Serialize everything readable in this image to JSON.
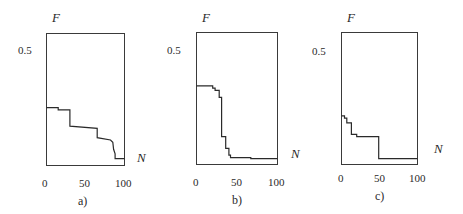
{
  "chart_data": [
    {
      "type": "line",
      "subplot_label": "a)",
      "xlabel": "N",
      "ylabel": "F",
      "x_ticks": [
        "0",
        "50",
        "100"
      ],
      "y_ticks": [
        "0.5"
      ],
      "xlim": [
        0,
        100
      ],
      "ylim": [
        0,
        0.57
      ],
      "grid": false,
      "step": true,
      "x": [
        0,
        15,
        15,
        30,
        30,
        65,
        65,
        82,
        85,
        86,
        88,
        88,
        100
      ],
      "y": [
        0.25,
        0.25,
        0.24,
        0.24,
        0.17,
        0.16,
        0.12,
        0.11,
        0.1,
        0.07,
        0.05,
        0.03,
        0.03
      ]
    },
    {
      "type": "line",
      "subplot_label": "b)",
      "xlabel": "N",
      "ylabel": "F",
      "x_ticks": [
        "0",
        "50",
        "100"
      ],
      "y_ticks": [
        "0.5"
      ],
      "xlim": [
        0,
        100
      ],
      "ylim": [
        0,
        0.57
      ],
      "grid": false,
      "step": true,
      "x": [
        0,
        20,
        20,
        23,
        23,
        28,
        28,
        31,
        31,
        36,
        36,
        40,
        40,
        42,
        42,
        67,
        67,
        100
      ],
      "y": [
        0.34,
        0.34,
        0.33,
        0.33,
        0.32,
        0.32,
        0.29,
        0.29,
        0.12,
        0.12,
        0.07,
        0.07,
        0.04,
        0.04,
        0.03,
        0.03,
        0.025,
        0.025
      ]
    },
    {
      "type": "line",
      "subplot_label": "c)",
      "xlabel": "N",
      "ylabel": "F",
      "x_ticks": [
        "0",
        "50",
        "100"
      ],
      "y_ticks": [
        "0.5"
      ],
      "xlim": [
        0,
        100
      ],
      "ylim": [
        0,
        0.57
      ],
      "grid": false,
      "step": true,
      "x": [
        0,
        4,
        4,
        7,
        7,
        13,
        13,
        20,
        20,
        49,
        49,
        100
      ],
      "y": [
        0.21,
        0.21,
        0.2,
        0.2,
        0.18,
        0.18,
        0.13,
        0.13,
        0.12,
        0.12,
        0.025,
        0.025
      ]
    }
  ],
  "panels": [
    {
      "label": "a)",
      "ylabel": "F",
      "xlabel": "N",
      "ytick": "0.5",
      "xticks": [
        "0",
        "50",
        "100"
      ]
    },
    {
      "label": "b)",
      "ylabel": "F",
      "xlabel": "N",
      "ytick": "0.5",
      "xticks": [
        "0",
        "50",
        "100"
      ]
    },
    {
      "label": "c)",
      "ylabel": "F",
      "xlabel": "N",
      "ytick": "0.5",
      "xticks": [
        "0",
        "50",
        "100"
      ]
    }
  ]
}
